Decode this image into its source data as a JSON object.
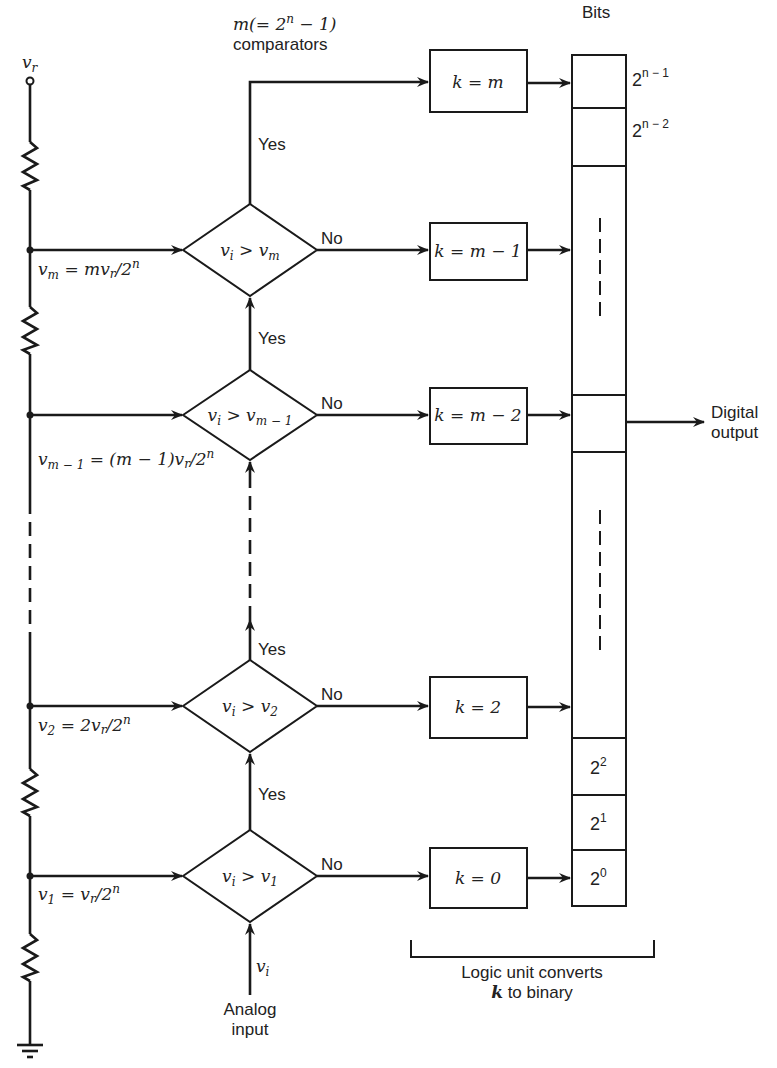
{
  "reference": {
    "terminal_label": "v_r",
    "ground_label": "ground"
  },
  "header": {
    "comparators_line1": "m(= 2^n − 1)",
    "comparators_line1_base": "m(= 2",
    "comparators_line1_exp": "n",
    "comparators_line1_tail": " − 1)",
    "comparators_line2": "comparators",
    "bits_label": "Bits"
  },
  "nodes": [
    {
      "id": "vm",
      "label_lhs": "v",
      "label_sub": "m",
      "label_rhs": " = mv",
      "label_rsub": "r",
      "label_tail": "/2",
      "label_exp": "n"
    },
    {
      "id": "vm1",
      "label_lhs": "v",
      "label_sub": "m − 1",
      "label_rhs": " = (m − 1)v",
      "label_rsub": "r",
      "label_tail": "/2",
      "label_exp": "n"
    },
    {
      "id": "v2",
      "label_lhs": "v",
      "label_sub": "2",
      "label_rhs": " = 2v",
      "label_rsub": "r",
      "label_tail": "/2",
      "label_exp": "n"
    },
    {
      "id": "v1",
      "label_lhs": "v",
      "label_sub": "1",
      "label_rhs": " = v",
      "label_rsub": "r",
      "label_tail": "/2",
      "label_exp": "n"
    }
  ],
  "comparators": [
    {
      "id": "cmp-m",
      "lhs": "v",
      "lhs_sub": "i",
      "op": " > ",
      "rhs": "v",
      "rhs_sub": "m"
    },
    {
      "id": "cmp-m1",
      "lhs": "v",
      "lhs_sub": "i",
      "op": " > ",
      "rhs": "v",
      "rhs_sub": "m − 1"
    },
    {
      "id": "cmp-2",
      "lhs": "v",
      "lhs_sub": "i",
      "op": " > ",
      "rhs": "v",
      "rhs_sub": "2"
    },
    {
      "id": "cmp-1",
      "lhs": "v",
      "lhs_sub": "i",
      "op": " > ",
      "rhs": "v",
      "rhs_sub": "1"
    }
  ],
  "branch_labels": {
    "yes": "Yes",
    "no": "No"
  },
  "logic_boxes": [
    {
      "id": "k-m",
      "label": "k = m"
    },
    {
      "id": "k-m1",
      "label": "k = m − 1"
    },
    {
      "id": "k-m2",
      "label": "k = m − 2"
    },
    {
      "id": "k-2",
      "label": "k = 2"
    },
    {
      "id": "k-0",
      "label": "k = 0"
    }
  ],
  "bits": [
    {
      "base": "2",
      "exp": "n − 1",
      "position": "outside"
    },
    {
      "base": "2",
      "exp": "n − 2",
      "position": "outside"
    },
    {
      "base": "2",
      "exp": "2",
      "position": "inside"
    },
    {
      "base": "2",
      "exp": "1",
      "position": "inside"
    },
    {
      "base": "2",
      "exp": "0",
      "position": "inside"
    }
  ],
  "output": {
    "line1": "Digital",
    "line2": "output"
  },
  "input": {
    "symbol": "v",
    "symbol_sub": "i",
    "line1": "Analog",
    "line2": "input"
  },
  "logic_unit": {
    "line1": "Logic unit converts",
    "line2_var": "k",
    "line2_rest": " to binary"
  }
}
